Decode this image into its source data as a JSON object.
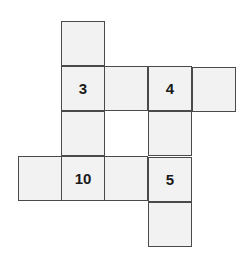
{
  "puzzle": {
    "cells": [
      {
        "row": 0,
        "col": 1,
        "value": ""
      },
      {
        "row": 1,
        "col": 1,
        "value": "3"
      },
      {
        "row": 1,
        "col": 2,
        "value": ""
      },
      {
        "row": 1,
        "col": 3,
        "value": "4"
      },
      {
        "row": 1,
        "col": 4,
        "value": ""
      },
      {
        "row": 2,
        "col": 1,
        "value": ""
      },
      {
        "row": 2,
        "col": 3,
        "value": ""
      },
      {
        "row": 3,
        "col": 0,
        "value": ""
      },
      {
        "row": 3,
        "col": 1,
        "value": "10"
      },
      {
        "row": 3,
        "col": 2,
        "value": ""
      },
      {
        "row": 3,
        "col": 3,
        "value": "5"
      },
      {
        "row": 4,
        "col": 3,
        "value": ""
      }
    ],
    "colors": {
      "cell_fill": "#f2f2f2",
      "border": "#4a4a4a",
      "text": "#1a1a1a",
      "background": "#ffffff"
    }
  }
}
